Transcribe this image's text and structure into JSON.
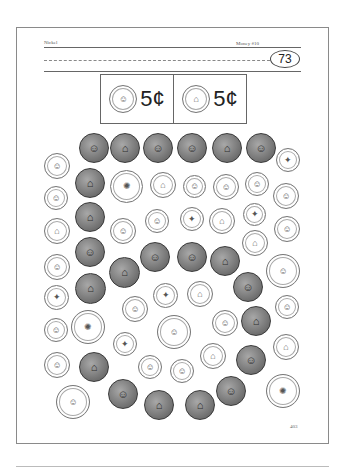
{
  "header": {
    "left": "Nickel",
    "right": "Money #10",
    "badge_number": "73"
  },
  "key": [
    {
      "coin": "nickel",
      "side": "heads",
      "glyph": "☺",
      "value": "5¢"
    },
    {
      "coin": "nickel",
      "side": "tails",
      "glyph": "⌂",
      "value": "5¢"
    }
  ],
  "instructions_hint": "Color the nickels",
  "coins": [
    {
      "type": "nickel",
      "side": "heads",
      "x": 79,
      "y": 133,
      "d": 30,
      "glyph": "☺"
    },
    {
      "type": "nickel",
      "side": "tails",
      "x": 110,
      "y": 133,
      "d": 30,
      "glyph": "⌂"
    },
    {
      "type": "nickel",
      "side": "heads",
      "x": 143,
      "y": 133,
      "d": 30,
      "glyph": "☺"
    },
    {
      "type": "nickel",
      "side": "heads",
      "x": 177,
      "y": 133,
      "d": 30,
      "glyph": "☺"
    },
    {
      "type": "nickel",
      "side": "tails",
      "x": 212,
      "y": 133,
      "d": 30,
      "glyph": "⌂"
    },
    {
      "type": "nickel",
      "side": "heads",
      "x": 246,
      "y": 133,
      "d": 30,
      "glyph": "☺"
    },
    {
      "type": "penny",
      "side": "heads",
      "x": 44,
      "y": 153,
      "d": 26,
      "glyph": "☺"
    },
    {
      "type": "dime",
      "side": "tails",
      "x": 276,
      "y": 148,
      "d": 24,
      "glyph": "✦"
    },
    {
      "type": "nickel",
      "side": "tails",
      "x": 75,
      "y": 168,
      "d": 30,
      "glyph": "⌂"
    },
    {
      "type": "quarter",
      "side": "tails",
      "x": 110,
      "y": 170,
      "d": 33,
      "glyph": "✺"
    },
    {
      "type": "penny",
      "side": "tails",
      "x": 150,
      "y": 172,
      "d": 26,
      "glyph": "⌂"
    },
    {
      "type": "dime",
      "side": "heads",
      "x": 183,
      "y": 175,
      "d": 23,
      "glyph": "☺"
    },
    {
      "type": "penny",
      "side": "heads",
      "x": 213,
      "y": 174,
      "d": 26,
      "glyph": "☺"
    },
    {
      "type": "dime",
      "side": "heads",
      "x": 245,
      "y": 172,
      "d": 24,
      "glyph": "☺"
    },
    {
      "type": "penny",
      "side": "heads",
      "x": 273,
      "y": 183,
      "d": 26,
      "glyph": "☺"
    },
    {
      "type": "dime",
      "side": "heads",
      "x": 44,
      "y": 186,
      "d": 24,
      "glyph": "☺"
    },
    {
      "type": "nickel",
      "side": "tails",
      "x": 75,
      "y": 202,
      "d": 30,
      "glyph": "⌂"
    },
    {
      "type": "penny",
      "side": "heads",
      "x": 110,
      "y": 218,
      "d": 26,
      "glyph": "☺"
    },
    {
      "type": "dime",
      "side": "heads",
      "x": 145,
      "y": 209,
      "d": 24,
      "glyph": "☺"
    },
    {
      "type": "dime",
      "side": "tails",
      "x": 180,
      "y": 207,
      "d": 24,
      "glyph": "✦"
    },
    {
      "type": "penny",
      "side": "tails",
      "x": 209,
      "y": 208,
      "d": 26,
      "glyph": "⌂"
    },
    {
      "type": "dime",
      "side": "tails",
      "x": 243,
      "y": 203,
      "d": 23,
      "glyph": "✦"
    },
    {
      "type": "penny",
      "side": "heads",
      "x": 274,
      "y": 216,
      "d": 26,
      "glyph": "☺"
    },
    {
      "type": "penny",
      "side": "tails",
      "x": 44,
      "y": 218,
      "d": 26,
      "glyph": "⌂"
    },
    {
      "type": "penny",
      "side": "tails",
      "x": 242,
      "y": 230,
      "d": 26,
      "glyph": "⌂"
    },
    {
      "type": "nickel",
      "side": "heads",
      "x": 75,
      "y": 237,
      "d": 30,
      "glyph": "☺"
    },
    {
      "type": "nickel",
      "side": "heads",
      "x": 140,
      "y": 242,
      "d": 30,
      "glyph": "☺"
    },
    {
      "type": "nickel",
      "side": "heads",
      "x": 177,
      "y": 242,
      "d": 30,
      "glyph": "☺"
    },
    {
      "type": "nickel",
      "side": "tails",
      "x": 109,
      "y": 257,
      "d": 31,
      "glyph": "⌂"
    },
    {
      "type": "nickel",
      "side": "tails",
      "x": 210,
      "y": 246,
      "d": 30,
      "glyph": "⌂"
    },
    {
      "type": "penny",
      "side": "heads",
      "x": 44,
      "y": 254,
      "d": 26,
      "glyph": "☺"
    },
    {
      "type": "quarter",
      "side": "heads",
      "x": 266,
      "y": 254,
      "d": 34,
      "glyph": "☺"
    },
    {
      "type": "nickel",
      "side": "tails",
      "x": 75,
      "y": 273,
      "d": 31,
      "glyph": "⌂"
    },
    {
      "type": "dime",
      "side": "tails",
      "x": 44,
      "y": 285,
      "d": 25,
      "glyph": "✦"
    },
    {
      "type": "dime",
      "side": "tails",
      "x": 153,
      "y": 283,
      "d": 25,
      "glyph": "✦"
    },
    {
      "type": "penny",
      "side": "tails",
      "x": 187,
      "y": 281,
      "d": 26,
      "glyph": "⌂"
    },
    {
      "type": "nickel",
      "side": "heads",
      "x": 233,
      "y": 272,
      "d": 30,
      "glyph": "☺"
    },
    {
      "type": "penny",
      "side": "heads",
      "x": 122,
      "y": 296,
      "d": 26,
      "glyph": "☺"
    },
    {
      "type": "dime",
      "side": "heads",
      "x": 275,
      "y": 295,
      "d": 24,
      "glyph": "☺"
    },
    {
      "type": "dime",
      "side": "heads",
      "x": 44,
      "y": 318,
      "d": 24,
      "glyph": "☺"
    },
    {
      "type": "quarter",
      "side": "tails",
      "x": 71,
      "y": 310,
      "d": 34,
      "glyph": "✺"
    },
    {
      "type": "quarter",
      "side": "heads",
      "x": 157,
      "y": 315,
      "d": 34,
      "glyph": "☺"
    },
    {
      "type": "penny",
      "side": "heads",
      "x": 212,
      "y": 310,
      "d": 26,
      "glyph": "☺"
    },
    {
      "type": "nickel",
      "side": "tails",
      "x": 241,
      "y": 306,
      "d": 30,
      "glyph": "⌂"
    },
    {
      "type": "dime",
      "side": "tails",
      "x": 113,
      "y": 332,
      "d": 24,
      "glyph": "✦"
    },
    {
      "type": "penny",
      "side": "tails",
      "x": 273,
      "y": 334,
      "d": 26,
      "glyph": "⌂"
    },
    {
      "type": "penny",
      "side": "tails",
      "x": 200,
      "y": 343,
      "d": 26,
      "glyph": "⌂"
    },
    {
      "type": "nickel",
      "side": "heads",
      "x": 236,
      "y": 345,
      "d": 30,
      "glyph": "☺"
    },
    {
      "type": "penny",
      "side": "heads",
      "x": 44,
      "y": 352,
      "d": 26,
      "glyph": "☺"
    },
    {
      "type": "nickel",
      "side": "tails",
      "x": 79,
      "y": 352,
      "d": 30,
      "glyph": "⌂"
    },
    {
      "type": "dime",
      "side": "heads",
      "x": 138,
      "y": 355,
      "d": 24,
      "glyph": "☺"
    },
    {
      "type": "dime",
      "side": "heads",
      "x": 170,
      "y": 359,
      "d": 24,
      "glyph": "☺"
    },
    {
      "type": "nickel",
      "side": "heads",
      "x": 108,
      "y": 379,
      "d": 30,
      "glyph": "☺"
    },
    {
      "type": "nickel",
      "side": "heads",
      "x": 216,
      "y": 376,
      "d": 30,
      "glyph": "☺"
    },
    {
      "type": "quarter",
      "side": "heads",
      "x": 56,
      "y": 385,
      "d": 34,
      "glyph": "☺"
    },
    {
      "type": "nickel",
      "side": "tails",
      "x": 144,
      "y": 390,
      "d": 30,
      "glyph": "⌂"
    },
    {
      "type": "nickel",
      "side": "tails",
      "x": 185,
      "y": 390,
      "d": 30,
      "glyph": "⌂"
    },
    {
      "type": "quarter",
      "side": "tails",
      "x": 266,
      "y": 374,
      "d": 34,
      "glyph": "✺"
    }
  ],
  "footer": {
    "page_number": "403"
  }
}
